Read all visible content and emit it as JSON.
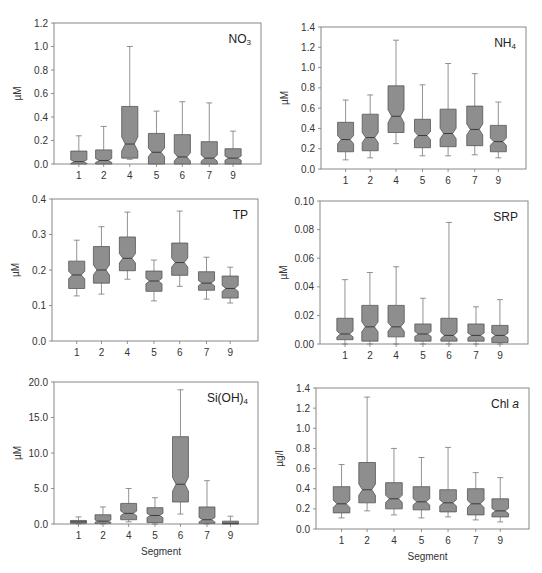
{
  "style": {
    "box_fill": "#8e8e8e",
    "box_stroke": "#555555",
    "frame_color": "#888888"
  },
  "chart_data": [
    {
      "type": "boxplot",
      "notched": true,
      "title": "NO3",
      "title_main": "NO",
      "title_sub": "3",
      "title_italic": "",
      "xlabel": "",
      "ylabel": "µM",
      "ylim": [
        0,
        1.2
      ],
      "yticks": [
        "0.0",
        "0.2",
        "0.4",
        "0.6",
        "0.8",
        "1.0",
        "1.2"
      ],
      "ytick_values": [
        0,
        0.2,
        0.4,
        0.6,
        0.8,
        1.0,
        1.2
      ],
      "categories": [
        "1",
        "2",
        "4",
        "5",
        "6",
        "7",
        "9"
      ],
      "boxes": [
        {
          "min": 0.0,
          "q1": 0.0,
          "median": 0.02,
          "q3": 0.11,
          "max": 0.24
        },
        {
          "min": 0.0,
          "q1": 0.0,
          "median": 0.03,
          "q3": 0.12,
          "max": 0.32
        },
        {
          "min": 0.04,
          "q1": 0.05,
          "median": 0.17,
          "q3": 0.49,
          "max": 1.0
        },
        {
          "min": 0.0,
          "q1": 0.0,
          "median": 0.1,
          "q3": 0.26,
          "max": 0.45
        },
        {
          "min": 0.0,
          "q1": 0.0,
          "median": 0.06,
          "q3": 0.25,
          "max": 0.53
        },
        {
          "min": 0.0,
          "q1": 0.0,
          "median": 0.05,
          "q3": 0.19,
          "max": 0.52
        },
        {
          "min": 0.0,
          "q1": 0.0,
          "median": 0.05,
          "q3": 0.13,
          "max": 0.28
        }
      ]
    },
    {
      "type": "boxplot",
      "notched": true,
      "title": "NH4",
      "title_main": "NH",
      "title_sub": "4",
      "title_italic": "",
      "xlabel": "",
      "ylabel": "µM",
      "ylim": [
        0,
        1.4
      ],
      "yticks": [
        "0.0",
        "0.2",
        "0.4",
        "0.6",
        "0.8",
        "1.0",
        "1.2",
        "1.4"
      ],
      "ytick_values": [
        0,
        0.2,
        0.4,
        0.6,
        0.8,
        1.0,
        1.2,
        1.4
      ],
      "categories": [
        "1",
        "2",
        "4",
        "5",
        "6",
        "7",
        "9"
      ],
      "boxes": [
        {
          "min": 0.09,
          "q1": 0.17,
          "median": 0.29,
          "q3": 0.46,
          "max": 0.68
        },
        {
          "min": 0.11,
          "q1": 0.18,
          "median": 0.31,
          "q3": 0.54,
          "max": 0.73
        },
        {
          "min": 0.25,
          "q1": 0.36,
          "median": 0.52,
          "q3": 0.82,
          "max": 1.27
        },
        {
          "min": 0.13,
          "q1": 0.21,
          "median": 0.33,
          "q3": 0.49,
          "max": 0.83
        },
        {
          "min": 0.13,
          "q1": 0.22,
          "median": 0.35,
          "q3": 0.59,
          "max": 1.04
        },
        {
          "min": 0.14,
          "q1": 0.23,
          "median": 0.39,
          "q3": 0.62,
          "max": 0.94
        },
        {
          "min": 0.11,
          "q1": 0.17,
          "median": 0.27,
          "q3": 0.43,
          "max": 0.66
        }
      ]
    },
    {
      "type": "boxplot",
      "notched": true,
      "title": "TP",
      "title_main": "TP",
      "title_sub": "",
      "title_italic": "",
      "xlabel": "",
      "ylabel": "µM",
      "ylim": [
        0,
        0.4
      ],
      "yticks": [
        "0.0",
        "0.1",
        "0.2",
        "0.3",
        "0.4"
      ],
      "ytick_values": [
        0,
        0.1,
        0.2,
        0.3,
        0.4
      ],
      "categories": [
        "1",
        "2",
        "4",
        "5",
        "6",
        "7",
        "9"
      ],
      "boxes": [
        {
          "min": 0.127,
          "q1": 0.148,
          "median": 0.186,
          "q3": 0.225,
          "max": 0.284
        },
        {
          "min": 0.132,
          "q1": 0.163,
          "median": 0.2,
          "q3": 0.266,
          "max": 0.322
        },
        {
          "min": 0.174,
          "q1": 0.198,
          "median": 0.233,
          "q3": 0.293,
          "max": 0.363
        },
        {
          "min": 0.113,
          "q1": 0.14,
          "median": 0.169,
          "q3": 0.197,
          "max": 0.228
        },
        {
          "min": 0.154,
          "q1": 0.185,
          "median": 0.221,
          "q3": 0.276,
          "max": 0.366
        },
        {
          "min": 0.118,
          "q1": 0.143,
          "median": 0.163,
          "q3": 0.195,
          "max": 0.236
        },
        {
          "min": 0.107,
          "q1": 0.121,
          "median": 0.148,
          "q3": 0.183,
          "max": 0.208
        }
      ]
    },
    {
      "type": "boxplot",
      "notched": true,
      "title": "SRP",
      "title_main": "SRP",
      "title_sub": "",
      "title_italic": "",
      "xlabel": "",
      "ylabel": "µM",
      "ylim": [
        0,
        0.1
      ],
      "yticks": [
        "0.00",
        "0.02",
        "0.04",
        "0.06",
        "0.08",
        "0.10"
      ],
      "ytick_values": [
        0,
        0.02,
        0.04,
        0.06,
        0.08,
        0.1
      ],
      "categories": [
        "1",
        "2",
        "4",
        "5",
        "6",
        "7",
        "9"
      ],
      "boxes": [
        {
          "min": 0.0,
          "q1": 0.003,
          "median": 0.007,
          "q3": 0.018,
          "max": 0.045
        },
        {
          "min": 0.0,
          "q1": 0.002,
          "median": 0.012,
          "q3": 0.027,
          "max": 0.05
        },
        {
          "min": 0.0,
          "q1": 0.005,
          "median": 0.012,
          "q3": 0.027,
          "max": 0.054
        },
        {
          "min": 0.0,
          "q1": 0.002,
          "median": 0.007,
          "q3": 0.014,
          "max": 0.032
        },
        {
          "min": 0.0,
          "q1": 0.002,
          "median": 0.006,
          "q3": 0.018,
          "max": 0.085
        },
        {
          "min": 0.0,
          "q1": 0.002,
          "median": 0.006,
          "q3": 0.014,
          "max": 0.026
        },
        {
          "min": 0.0,
          "q1": 0.001,
          "median": 0.006,
          "q3": 0.013,
          "max": 0.031
        }
      ]
    },
    {
      "type": "boxplot",
      "notched": true,
      "title": "Si(OH)4",
      "title_main": "Si(OH)",
      "title_sub": "4",
      "title_italic": "",
      "xlabel": "Segment",
      "ylabel": "µM",
      "ylim": [
        0,
        20
      ],
      "yticks": [
        "0.0",
        "5.0",
        "10.0",
        "15.0",
        "20.0"
      ],
      "ytick_values": [
        0,
        5,
        10,
        15,
        20
      ],
      "categories": [
        "1",
        "2",
        "4",
        "5",
        "6",
        "7",
        "9"
      ],
      "boxes": [
        {
          "min": 0.0,
          "q1": 0.1,
          "median": 0.3,
          "q3": 0.5,
          "max": 1.0
        },
        {
          "min": 0.0,
          "q1": 0.1,
          "median": 0.4,
          "q3": 1.3,
          "max": 2.4
        },
        {
          "min": 0.3,
          "q1": 0.6,
          "median": 1.5,
          "q3": 2.9,
          "max": 5.0
        },
        {
          "min": 0.0,
          "q1": 0.2,
          "median": 1.2,
          "q3": 2.3,
          "max": 3.7
        },
        {
          "min": 1.4,
          "q1": 3.1,
          "median": 5.6,
          "q3": 12.3,
          "max": 18.9
        },
        {
          "min": 0.0,
          "q1": 0.1,
          "median": 0.6,
          "q3": 2.4,
          "max": 6.1
        },
        {
          "min": 0.0,
          "q1": 0.0,
          "median": 0.1,
          "q3": 0.4,
          "max": 1.1
        }
      ]
    },
    {
      "type": "boxplot",
      "notched": true,
      "title": "Chl a",
      "title_main": "Chl ",
      "title_sub": "",
      "title_italic": "a",
      "xlabel": "Segment",
      "ylabel": "µg/l",
      "ylim": [
        0,
        1.4
      ],
      "yticks": [
        "0.0",
        "0.2",
        "0.4",
        "0.6",
        "0.8",
        "1.0",
        "1.2",
        "1.4"
      ],
      "ytick_values": [
        0,
        0.2,
        0.4,
        0.6,
        0.8,
        1.0,
        1.2,
        1.4
      ],
      "categories": [
        "1",
        "2",
        "4",
        "5",
        "6",
        "7",
        "9"
      ],
      "boxes": [
        {
          "min": 0.11,
          "q1": 0.16,
          "median": 0.25,
          "q3": 0.42,
          "max": 0.64
        },
        {
          "min": 0.18,
          "q1": 0.26,
          "median": 0.39,
          "q3": 0.66,
          "max": 1.31
        },
        {
          "min": 0.14,
          "q1": 0.2,
          "median": 0.3,
          "q3": 0.46,
          "max": 0.8
        },
        {
          "min": 0.11,
          "q1": 0.19,
          "median": 0.27,
          "q3": 0.42,
          "max": 0.71
        },
        {
          "min": 0.12,
          "q1": 0.17,
          "median": 0.26,
          "q3": 0.39,
          "max": 0.81
        },
        {
          "min": 0.09,
          "q1": 0.14,
          "median": 0.25,
          "q3": 0.4,
          "max": 0.56
        },
        {
          "min": 0.07,
          "q1": 0.12,
          "median": 0.18,
          "q3": 0.3,
          "max": 0.51
        }
      ]
    }
  ]
}
